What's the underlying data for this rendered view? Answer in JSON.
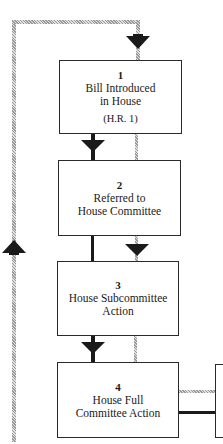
{
  "diagram": {
    "steps": [
      {
        "number": "1",
        "lines": [
          "Bill Introduced",
          "in House"
        ],
        "sub": "(H.R. 1)"
      },
      {
        "number": "2",
        "lines": [
          "Referred to",
          "House Committee"
        ]
      },
      {
        "number": "3",
        "lines": [
          "House Subcommittee",
          "Action"
        ]
      },
      {
        "number": "4",
        "lines": [
          "House Full",
          "Committee Action"
        ]
      }
    ],
    "connectors": {
      "black_path": "main flow arrows (solid black)",
      "gray_path": "alternate flow (hatched gray)"
    },
    "colors": {
      "black_line": "#1a1a1a",
      "gray_line": "#9a9a9a",
      "box_border": "#2a2a2a"
    }
  }
}
